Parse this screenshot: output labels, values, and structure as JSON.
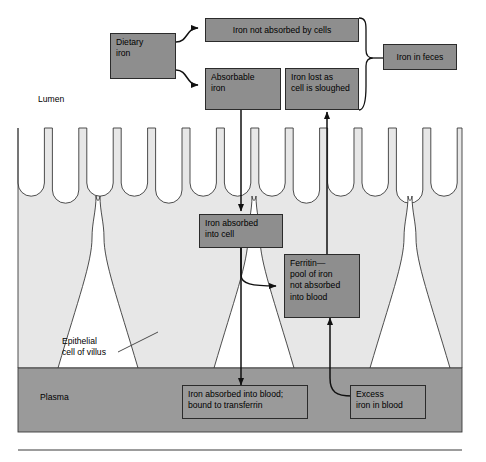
{
  "figure": {
    "type": "flow-diagram",
    "colors": {
      "box_fill": "#8e8e8e",
      "box_stroke": "#2b2b2b",
      "tissue_fill": "#e7e7e7",
      "plasma_fill": "#9a9a9a",
      "lumen_fill": "#ffffff",
      "arrow": "#111111"
    }
  },
  "regions": [
    {
      "id": "lumen",
      "label": "Lumen"
    },
    {
      "id": "plasma",
      "label": "Plasma"
    }
  ],
  "annotations": [
    {
      "id": "epithelial-cell",
      "line1": "Epithelial",
      "line2": "cell of villus"
    }
  ],
  "boxes": [
    {
      "id": "dietary-iron",
      "line1": "Dietary",
      "line2": "iron",
      "align": "left"
    },
    {
      "id": "iron-not-absorbed",
      "line1": "Iron not absorbed by cells",
      "align": "center"
    },
    {
      "id": "absorbable-iron",
      "line1": "Absorbable",
      "line2": "iron",
      "align": "left"
    },
    {
      "id": "iron-lost-sloughed",
      "line1": "Iron lost as",
      "line2": "cell is sloughed",
      "align": "left"
    },
    {
      "id": "iron-in-feces",
      "line1": "Iron in feces",
      "align": "center"
    },
    {
      "id": "iron-absorbed-cell",
      "line1": "Iron absorbed",
      "line2": "into cell",
      "align": "left"
    },
    {
      "id": "ferritin-pool",
      "line1": "Ferritin—",
      "line2": "pool of iron",
      "line3": "not absorbed",
      "line4": "into blood",
      "align": "left"
    },
    {
      "id": "iron-absorbed-blood",
      "line1": "Iron absorbed into blood;",
      "line2": "bound to transferrin",
      "align": "left"
    },
    {
      "id": "excess-iron-blood",
      "line1": "Excess",
      "line2": "iron in blood",
      "align": "left"
    }
  ],
  "flows": [
    {
      "from": "dietary-iron",
      "to": "iron-not-absorbed",
      "style": "curved"
    },
    {
      "from": "dietary-iron",
      "to": "absorbable-iron",
      "style": "curved"
    },
    {
      "from": "iron-not-absorbed",
      "to": "iron-in-feces",
      "style": "brace"
    },
    {
      "from": "iron-lost-sloughed",
      "to": "iron-in-feces",
      "style": "brace"
    },
    {
      "from": "absorbable-iron",
      "to": "iron-absorbed-cell",
      "style": "straight-down"
    },
    {
      "from": "iron-absorbed-cell",
      "to": "ferritin-pool",
      "style": "curved"
    },
    {
      "from": "iron-absorbed-cell",
      "to": "iron-absorbed-blood",
      "style": "straight-down"
    },
    {
      "from": "ferritin-pool",
      "to": "iron-lost-sloughed",
      "style": "straight-up"
    },
    {
      "from": "excess-iron-blood",
      "to": "ferritin-pool",
      "style": "curved-up"
    }
  ]
}
